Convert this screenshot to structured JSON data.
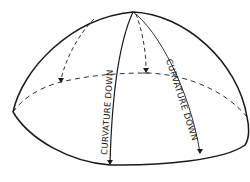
{
  "diagram": {
    "type": "hemisphere-dome-sketch",
    "labels": {
      "front_meridian": "CURVATURE DOWN",
      "right_meridian": "CURVATURE DOWN"
    },
    "colors": {
      "line": "#1a1a1a",
      "background": "#ffffff"
    }
  }
}
